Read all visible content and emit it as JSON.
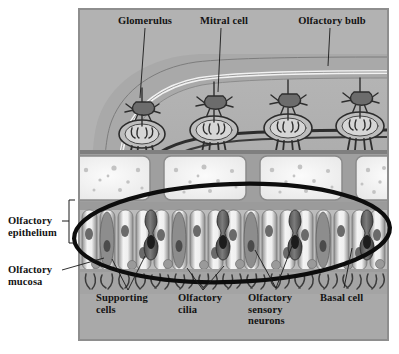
{
  "figure": {
    "kind": "anatomical-diagram",
    "panel_background": "#a9a9a9",
    "panel_border": "#8e8e8e",
    "text_color": "#131313",
    "annotation_color": "#0d0d0d"
  },
  "labels": {
    "top": [
      {
        "id": "glomerulus",
        "text": "Glomerulus"
      },
      {
        "id": "mitral-cell",
        "text": "Mitral cell"
      },
      {
        "id": "olfactory-bulb",
        "text": "Olfactory bulb"
      }
    ],
    "left": [
      {
        "id": "olfactory-epithelium",
        "text": "Olfactory\nepithelium"
      },
      {
        "id": "olfactory-mucosa",
        "text": "Olfactory\nmucosa"
      }
    ],
    "bottom": [
      {
        "id": "supporting-cells",
        "text": "Supporting\ncells"
      },
      {
        "id": "olfactory-cilia",
        "text": "Olfactory\ncilia"
      },
      {
        "id": "olfactory-sensory-neurons",
        "text": "Olfactory\nsensory\nneurons"
      },
      {
        "id": "basal-cell",
        "text": "Basal cell"
      }
    ]
  },
  "annotation": {
    "shape": "hand-drawn-ellipse",
    "encircles": "olfactory epithelium layer",
    "stroke_color": "#0d0d0d",
    "stroke_width": 4
  },
  "anatomy": {
    "layers": [
      {
        "id": "olfactory-bulb-tissue",
        "label": "Olfactory bulb"
      },
      {
        "id": "glomerular-layer",
        "label": "Glomeruli"
      },
      {
        "id": "cribriform-plate",
        "label": "Cribriform plate (bone)"
      },
      {
        "id": "lamina-propria",
        "label": "Lamina propria"
      },
      {
        "id": "olfactory-epithelium",
        "label": "Olfactory epithelium"
      },
      {
        "id": "mucus-cilia-layer",
        "label": "Mucus and cilia"
      }
    ],
    "glomeruli_count": 4,
    "mitral_cells_count": 4
  },
  "caption_fragment": {
    "text": ""
  }
}
